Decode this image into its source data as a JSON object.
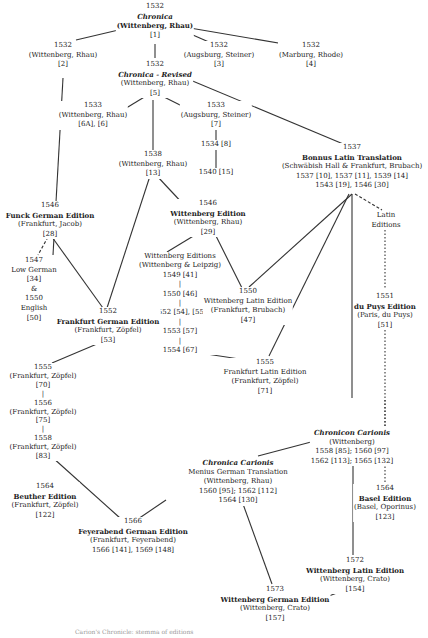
{
  "diagram": {
    "type": "publication stemma / edition tree",
    "nodes": [
      {
        "id": "n1",
        "lines": [
          {
            "t": "1532",
            "s": "plain"
          },
          {
            "t": "Chronica",
            "s": "ital"
          },
          {
            "t": "(Wittenberg, Rhau)",
            "s": "title"
          },
          {
            "t": "[1]",
            "s": "plain"
          }
        ]
      },
      {
        "id": "n2",
        "lines": [
          {
            "t": "1532",
            "s": "plain"
          },
          {
            "t": "(Wittenberg, Rhau)",
            "s": "plain"
          },
          {
            "t": "[2]",
            "s": "plain"
          }
        ]
      },
      {
        "id": "n3",
        "lines": [
          {
            "t": "1532",
            "s": "plain"
          },
          {
            "t": "(Augsburg, Steiner)",
            "s": "plain"
          },
          {
            "t": "[3]",
            "s": "plain"
          }
        ]
      },
      {
        "id": "n4",
        "lines": [
          {
            "t": "1532",
            "s": "plain"
          },
          {
            "t": "(Marburg, Rhode)",
            "s": "plain"
          },
          {
            "t": "[4]",
            "s": "plain"
          }
        ]
      },
      {
        "id": "n5",
        "lines": [
          {
            "t": "1532",
            "s": "plain"
          },
          {
            "t": "Chronica - Revised",
            "s": "ital"
          },
          {
            "t": "(Wittenberg, Rhau)",
            "s": "plain"
          },
          {
            "t": "[5]",
            "s": "plain"
          }
        ]
      },
      {
        "id": "n6",
        "lines": [
          {
            "t": "1533",
            "s": "plain"
          },
          {
            "t": "(Wittenberg, Rhau)",
            "s": "plain"
          },
          {
            "t": "[6A], [6]",
            "s": "plain"
          }
        ]
      },
      {
        "id": "n7",
        "lines": [
          {
            "t": "1533",
            "s": "plain"
          },
          {
            "t": "(Augsburg, Steiner)",
            "s": "plain"
          },
          {
            "t": "[7]",
            "s": "plain"
          }
        ]
      },
      {
        "id": "n8",
        "lines": [
          {
            "t": "1534 [8]",
            "s": "plain"
          }
        ]
      },
      {
        "id": "n15",
        "lines": [
          {
            "t": "1540 [15]",
            "s": "plain"
          }
        ]
      },
      {
        "id": "n13",
        "lines": [
          {
            "t": "1538",
            "s": "plain"
          },
          {
            "t": "(Wittenberg, Rhau)",
            "s": "plain"
          },
          {
            "t": "[13]",
            "s": "plain"
          }
        ]
      },
      {
        "id": "bonnus",
        "lines": [
          {
            "t": "1537",
            "s": "plain"
          },
          {
            "t": "Bonnus Latin Translation",
            "s": "title"
          },
          {
            "t": "(Schwäbish Hall & Frankfurt, Brubach)",
            "s": "plain"
          },
          {
            "t": "1537 [10], 1537 [11], 1539 [14]",
            "s": "plain"
          },
          {
            "t": "1543 [19], 1546 [30]",
            "s": "plain"
          }
        ]
      },
      {
        "id": "funck",
        "lines": [
          {
            "t": "1546",
            "s": "plain"
          },
          {
            "t": "Funck German Edition",
            "s": "title"
          },
          {
            "t": "(Frankfurt, Jacob)",
            "s": "plain"
          },
          {
            "t": "[28]",
            "s": "plain"
          }
        ]
      },
      {
        "id": "wittenberg1546",
        "lines": [
          {
            "t": "1546",
            "s": "plain"
          },
          {
            "t": "Wittenberg Edition",
            "s": "title"
          },
          {
            "t": "(Wittenberg, Rhau)",
            "s": "plain"
          },
          {
            "t": "[29]",
            "s": "plain"
          }
        ]
      },
      {
        "id": "latin_editions",
        "lines": [
          {
            "t": "Latin",
            "s": "plain"
          },
          {
            "t": "Editions",
            "s": "plain"
          }
        ]
      },
      {
        "id": "lowgerman",
        "lines": [
          {
            "t": "1547",
            "s": "plain"
          },
          {
            "t": "Low German",
            "s": "plain"
          },
          {
            "t": "[34]",
            "s": "plain"
          },
          {
            "t": "&",
            "s": "plain"
          },
          {
            "t": "1550",
            "s": "plain"
          },
          {
            "t": "English",
            "s": "plain"
          },
          {
            "t": "[50]",
            "s": "plain"
          }
        ]
      },
      {
        "id": "wittenberg_editions",
        "lines": [
          {
            "t": "Wittenberg Editions",
            "s": "plain"
          },
          {
            "t": "(Wittenberg & Leipzig)",
            "s": "plain"
          },
          {
            "t": "1549 [41]",
            "s": "plain"
          },
          {
            "t": "|",
            "s": "plain"
          },
          {
            "t": "1550 [46]",
            "s": "plain"
          },
          {
            "t": "|",
            "s": "plain"
          },
          {
            "t": "1552 [54], [55]",
            "s": "plain"
          },
          {
            "t": "|",
            "s": "plain"
          },
          {
            "t": "1553 [57]",
            "s": "plain"
          },
          {
            "t": "|",
            "s": "plain"
          },
          {
            "t": "1554 [67]",
            "s": "plain"
          }
        ]
      },
      {
        "id": "wlatin1550",
        "lines": [
          {
            "t": "1550",
            "s": "plain"
          },
          {
            "t": "Wittenberg Latin Edition",
            "s": "plain"
          },
          {
            "t": "(Frankfurt, Brubach)",
            "s": "plain"
          },
          {
            "t": "[47]",
            "s": "plain"
          }
        ]
      },
      {
        "id": "dupuys",
        "lines": [
          {
            "t": "1551",
            "s": "plain"
          },
          {
            "t": "du Puys Edition",
            "s": "title"
          },
          {
            "t": "(Paris, du Puys)",
            "s": "plain"
          },
          {
            "t": "[51]",
            "s": "plain"
          }
        ]
      },
      {
        "id": "frankfurt_german",
        "lines": [
          {
            "t": "1552",
            "s": "plain"
          },
          {
            "t": "Frankfurt German Edition",
            "s": "title"
          },
          {
            "t": "(Frankfurt, Zöpfel)",
            "s": "plain"
          },
          {
            "t": "[53]",
            "s": "plain"
          }
        ]
      },
      {
        "id": "n70",
        "lines": [
          {
            "t": "1555",
            "s": "plain"
          },
          {
            "t": "(Frankfurt, Zöpfel)",
            "s": "plain"
          },
          {
            "t": "[70]",
            "s": "plain"
          },
          {
            "t": "|",
            "s": "plain"
          },
          {
            "t": "1556",
            "s": "plain"
          },
          {
            "t": "(Frankfurt, Zöpfel)",
            "s": "plain"
          },
          {
            "t": "[75]",
            "s": "plain"
          },
          {
            "t": "|",
            "s": "plain"
          },
          {
            "t": "1558",
            "s": "plain"
          },
          {
            "t": "(Frankfurt, Zöpfel)",
            "s": "plain"
          },
          {
            "t": "[83]",
            "s": "plain"
          }
        ]
      },
      {
        "id": "frankfurt_latin",
        "lines": [
          {
            "t": "1555",
            "s": "plain"
          },
          {
            "t": "Frankfurt Latin Edition",
            "s": "plain"
          },
          {
            "t": "(Frankfurt, Zöpfel)",
            "s": "plain"
          },
          {
            "t": "[71]",
            "s": "plain"
          }
        ]
      },
      {
        "id": "chronicon",
        "lines": [
          {
            "t": "Chronicon Carionis",
            "s": "ital"
          },
          {
            "t": "(Wittenberg)",
            "s": "plain"
          },
          {
            "t": "1558 [85]; 1560 [97]",
            "s": "plain"
          },
          {
            "t": "1562 [113]; 1565 [132]",
            "s": "plain"
          }
        ]
      },
      {
        "id": "menius",
        "lines": [
          {
            "t": "Chronica Carionis",
            "s": "ital"
          },
          {
            "t": "Menius German Translation",
            "s": "plain"
          },
          {
            "t": "(Wittenberg, Rhau)",
            "s": "plain"
          },
          {
            "t": "1560 [95]; 1562 [112]",
            "s": "plain"
          },
          {
            "t": "1564 [130]",
            "s": "plain"
          }
        ]
      },
      {
        "id": "beuther",
        "lines": [
          {
            "t": "1564",
            "s": "plain"
          },
          {
            "t": "Beuther Edition",
            "s": "title"
          },
          {
            "t": "(Frankfurt, Zöpfel)",
            "s": "plain"
          },
          {
            "t": "[122]",
            "s": "plain"
          }
        ]
      },
      {
        "id": "basel",
        "lines": [
          {
            "t": "1564",
            "s": "plain"
          },
          {
            "t": "Basel Edition",
            "s": "title"
          },
          {
            "t": "(Basel, Oporinus)",
            "s": "plain"
          },
          {
            "t": "[123]",
            "s": "plain"
          }
        ]
      },
      {
        "id": "feyerabend",
        "lines": [
          {
            "t": "1566",
            "s": "plain"
          },
          {
            "t": "Feyerabend German Edition",
            "s": "title"
          },
          {
            "t": "(Frankfurt, Feyerabend)",
            "s": "plain"
          },
          {
            "t": "1566 [141], 1569 [148]",
            "s": "plain"
          }
        ]
      },
      {
        "id": "wlatin1572",
        "lines": [
          {
            "t": "1572",
            "s": "plain"
          },
          {
            "t": "Wittenberg Latin Edition",
            "s": "title"
          },
          {
            "t": "(Wittenberg, Crato)",
            "s": "plain"
          },
          {
            "t": "[154]",
            "s": "plain"
          }
        ]
      },
      {
        "id": "wgerman1573",
        "lines": [
          {
            "t": "1573",
            "s": "plain"
          },
          {
            "t": "Wittenberg German Edition",
            "s": "title"
          },
          {
            "t": "(Wittenberg, Crato)",
            "s": "plain"
          },
          {
            "t": "[157]",
            "s": "plain"
          }
        ]
      }
    ],
    "caption": "Carion's Chronicle: stemma of editions"
  }
}
